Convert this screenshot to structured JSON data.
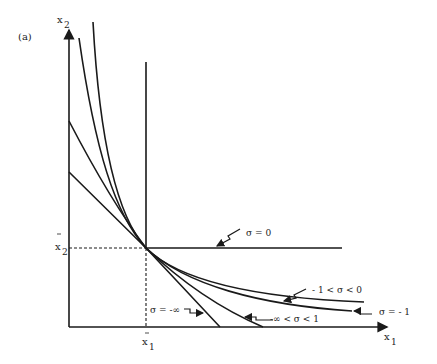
{
  "figure": {
    "panel_label": "(a)",
    "x_axis_label": "x",
    "x_axis_sub": "1",
    "y_axis_label": "x",
    "y_axis_sub": "2",
    "x_bar_label": "x",
    "x_bar_sub": "1",
    "y_bar_label": "x",
    "y_bar_sub": "2"
  },
  "curves": [
    {
      "id": "sigma-zero",
      "label": "σ = 0"
    },
    {
      "id": "sigma-between-minus1-and-0",
      "label": "- 1 < σ < 0"
    },
    {
      "id": "sigma-minus1",
      "label": "σ = - 1"
    },
    {
      "id": "sigma-minus-inf-to-1",
      "label": "-∞ < σ < 1"
    },
    {
      "id": "sigma-minus-inf",
      "label": "σ = -∞"
    }
  ],
  "colors": {
    "ink": "#1a1a1a",
    "background": "#ffffff"
  }
}
